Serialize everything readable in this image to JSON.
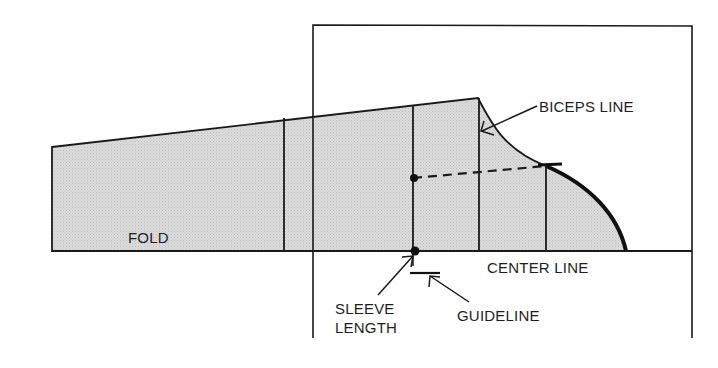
{
  "diagram": {
    "colors": {
      "fill": "#d9d9d9",
      "line": "#1a1a1a",
      "background": "#ffffff"
    },
    "labels": {
      "biceps_line": "BICEPS LINE",
      "fold": "FOLD",
      "center_line": "CENTER LINE",
      "sleeve_length_1": "SLEEVE",
      "sleeve_length_2": "LENGTH",
      "guideline": "GUIDELINE"
    }
  }
}
